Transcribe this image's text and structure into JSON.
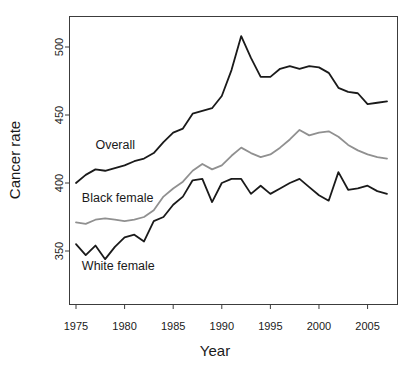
{
  "chart_data": {
    "type": "line",
    "title": "",
    "xlabel": "Year",
    "ylabel": "Cancer rate",
    "xlim": [
      1975,
      2007
    ],
    "ylim": [
      325,
      515
    ],
    "grid": false,
    "legend_position": "inline-labels",
    "xticks": [
      1975,
      1980,
      1985,
      1990,
      1995,
      2000,
      2005
    ],
    "yticks": [
      350,
      400,
      450,
      500
    ],
    "x": [
      1975,
      1976,
      1977,
      1978,
      1979,
      1980,
      1981,
      1982,
      1983,
      1984,
      1985,
      1986,
      1987,
      1988,
      1989,
      1990,
      1991,
      1992,
      1993,
      1994,
      1995,
      1996,
      1997,
      1998,
      1999,
      2000,
      2001,
      2002,
      2003,
      2004,
      2005,
      2006,
      2007
    ],
    "series": [
      {
        "name": "Overall",
        "color": "#1a1a1a",
        "label_x": 1977.0,
        "label_y": 425,
        "values": [
          400,
          406,
          410,
          409,
          411,
          413,
          416,
          418,
          422,
          430,
          437,
          440,
          451,
          453,
          455,
          464,
          483,
          508,
          492,
          478,
          478,
          484,
          486,
          484,
          486,
          485,
          481,
          470,
          467,
          466,
          458,
          459,
          460
        ]
      },
      {
        "name": "Black female",
        "color": "#909090",
        "label_x": 1975.6,
        "label_y": 386,
        "values": [
          371,
          370,
          373,
          374,
          373,
          372,
          373,
          375,
          380,
          390,
          396,
          401,
          409,
          414,
          410,
          413,
          420,
          426,
          422,
          419,
          421,
          426,
          432,
          439,
          435,
          437,
          438,
          434,
          428,
          424,
          421,
          419,
          418
        ]
      },
      {
        "name": "White female",
        "color": "#1a1a1a",
        "label_x": 1975.6,
        "label_y": 336,
        "values": [
          355,
          347,
          354,
          344,
          353,
          360,
          362,
          357,
          372,
          375,
          384,
          390,
          402,
          403,
          386,
          400,
          403,
          403,
          392,
          398,
          392,
          396,
          400,
          403,
          397,
          391,
          387,
          408,
          395,
          396,
          398,
          394,
          392
        ]
      }
    ]
  }
}
